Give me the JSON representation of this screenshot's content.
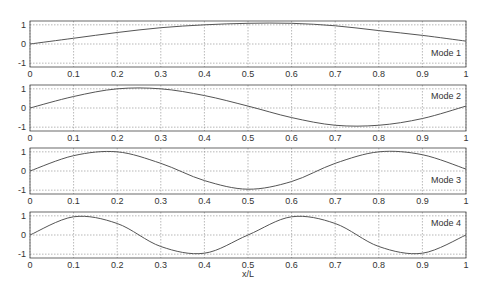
{
  "chart_data": [
    {
      "type": "line",
      "title": "",
      "legend": "Mode 1",
      "xlabel": "",
      "ylabel": "",
      "xlim": [
        0,
        1
      ],
      "ylim": [
        -1.2,
        1.2
      ],
      "grid": true,
      "x": [
        0,
        0.1,
        0.2,
        0.3,
        0.4,
        0.5,
        0.6,
        0.7,
        0.8,
        0.9,
        1.0
      ],
      "series": [
        {
          "name": "Mode 1",
          "values": [
            0,
            0.3,
            0.6,
            0.85,
            1.0,
            1.08,
            1.08,
            0.95,
            0.7,
            0.45,
            0.15
          ]
        }
      ]
    },
    {
      "type": "line",
      "title": "",
      "legend": "Mode 2",
      "xlabel": "",
      "ylabel": "",
      "xlim": [
        0,
        1
      ],
      "ylim": [
        -1.2,
        1.2
      ],
      "grid": true,
      "x": [
        0,
        0.1,
        0.2,
        0.3,
        0.4,
        0.5,
        0.6,
        0.7,
        0.8,
        0.9,
        1.0
      ],
      "series": [
        {
          "name": "Mode 2",
          "values": [
            0,
            0.6,
            1.0,
            1.0,
            0.65,
            0.1,
            -0.5,
            -0.9,
            -0.9,
            -0.55,
            0.1
          ]
        }
      ]
    },
    {
      "type": "line",
      "title": "",
      "legend": "Mode 3",
      "xlabel": "",
      "ylabel": "",
      "xlim": [
        0,
        1
      ],
      "ylim": [
        -1.2,
        1.2
      ],
      "grid": true,
      "x": [
        0,
        0.1,
        0.2,
        0.3,
        0.4,
        0.5,
        0.6,
        0.7,
        0.8,
        0.9,
        1.0
      ],
      "series": [
        {
          "name": "Mode 3",
          "values": [
            0,
            0.8,
            1.0,
            0.4,
            -0.5,
            -0.95,
            -0.55,
            0.4,
            1.0,
            0.85,
            0.1
          ]
        }
      ]
    },
    {
      "type": "line",
      "title": "",
      "legend": "Mode 4",
      "xlabel": "x/L",
      "ylabel": "",
      "xlim": [
        0,
        1
      ],
      "ylim": [
        -1.2,
        1.2
      ],
      "grid": true,
      "x": [
        0,
        0.1,
        0.2,
        0.3,
        0.4,
        0.5,
        0.6,
        0.7,
        0.8,
        0.9,
        1.0
      ],
      "series": [
        {
          "name": "Mode 4",
          "values": [
            0,
            0.95,
            0.6,
            -0.6,
            -0.95,
            0,
            0.95,
            0.6,
            -0.6,
            -0.95,
            0
          ]
        }
      ]
    }
  ],
  "axes": {
    "xticks": [
      "0",
      "0.1",
      "0.2",
      "0.3",
      "0.4",
      "0.5",
      "0.6",
      "0.7",
      "0.8",
      "0.9",
      "1"
    ],
    "yticks": [
      "1",
      "0",
      "-1"
    ],
    "xlabel": "x/L"
  },
  "legends": [
    "Mode 1",
    "Mode 2",
    "Mode 3",
    "Mode 4"
  ],
  "colors": {
    "line": "#555555",
    "grid": "#888888",
    "frame": "#444444"
  }
}
